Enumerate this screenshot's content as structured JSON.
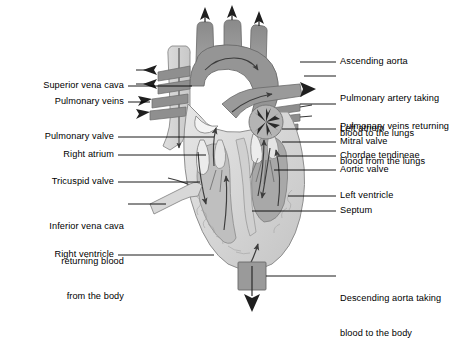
{
  "figure": {
    "background_color": "#ffffff",
    "text_color": "#000000",
    "leader_line_color": "#000000",
    "palette": {
      "vessel_dark_gray": "#8c8c8c",
      "vessel_mid_gray": "#9e9e9e",
      "muscle_light_gray": "#d6d6d6",
      "muscle_pale_gray": "#e2e2e2",
      "chamber_gray": "#c2c2c2",
      "outline_gray": "#6e6e6e",
      "arrow_dark": "#4a4a4a",
      "valve_white": "#f5f5f5"
    }
  },
  "labels_left": [
    {
      "id": "superior-vena-cava",
      "text": "Superior vena cava",
      "lines": [
        "Superior vena cava"
      ]
    },
    {
      "id": "pulmonary-veins",
      "text": "Pulmonary veins",
      "lines": [
        "Pulmonary veins"
      ]
    },
    {
      "id": "pulmonary-valve",
      "text": "Pulmonary valve",
      "lines": [
        "Pulmonary valve"
      ]
    },
    {
      "id": "right-atrium",
      "text": "Right atrium",
      "lines": [
        "Right atrium"
      ]
    },
    {
      "id": "tricuspid-valve",
      "text": "Tricuspid valve",
      "lines": [
        "Tricuspid valve"
      ]
    },
    {
      "id": "inferior-vena-cava",
      "text": "Inferior vena cava returning blood from the body",
      "lines": [
        "Inferior vena cava",
        "returning blood",
        "from the body"
      ]
    },
    {
      "id": "right-ventricle",
      "text": "Right ventricle",
      "lines": [
        "Right ventricle"
      ]
    }
  ],
  "labels_right": [
    {
      "id": "ascending-aorta",
      "text": "Ascending aorta",
      "lines": [
        "Ascending aorta"
      ]
    },
    {
      "id": "pulmonary-artery",
      "text": "Pulmonary artery taking blood to the lungs",
      "lines": [
        "Pulmonary artery taking",
        "blood to the lungs"
      ]
    },
    {
      "id": "pulmonary-veins-returning",
      "text": "Pulmonary veins returning blood from the lungs",
      "lines": [
        "Pulmonary veins returning",
        "blood from the lungs"
      ]
    },
    {
      "id": "left-atrium",
      "text": "Left atrium",
      "lines": [
        "Left atrium"
      ]
    },
    {
      "id": "mitral-valve",
      "text": "Mitral valve",
      "lines": [
        "Mitral valve"
      ]
    },
    {
      "id": "chordae-tendineae",
      "text": "Chordae tendineae",
      "lines": [
        "Chordae tendineae"
      ]
    },
    {
      "id": "aortic-valve",
      "text": "Aortic valve",
      "lines": [
        "Aortic valve"
      ]
    },
    {
      "id": "left-ventricle",
      "text": "Left ventricle",
      "lines": [
        "Left ventricle"
      ]
    },
    {
      "id": "septum",
      "text": "Septum",
      "lines": [
        "Septum"
      ]
    },
    {
      "id": "descending-aorta",
      "text": "Descending aorta taking blood to the body",
      "lines": [
        "Descending aorta taking",
        "blood to the body"
      ]
    }
  ]
}
